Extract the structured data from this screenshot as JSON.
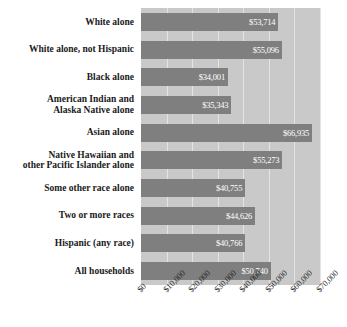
{
  "chart_data": {
    "type": "bar",
    "orientation": "horizontal",
    "title": "",
    "xlabel": "",
    "ylabel": "",
    "xlim": [
      0,
      70000
    ],
    "grid": true,
    "legend": "none",
    "bar_color": "#7f7f7f",
    "plot_background": "#c9c9c9",
    "value_label_color": "#ffffff",
    "categories": [
      "White alone",
      "White alone, not Hispanic",
      "Black alone",
      "American Indian and\nAlaska Native alone",
      "Asian alone",
      "Native Hawaiian and\nother Pacific Islander alone",
      "Some other race alone",
      "Two or more races",
      "Hispanic (any race)",
      "All households"
    ],
    "values": [
      53714,
      55096,
      34001,
      35343,
      66935,
      55273,
      40755,
      44626,
      40766,
      50740
    ],
    "value_labels": [
      "$53,714",
      "$55,096",
      "$34,001",
      "$35,343",
      "$66,935",
      "$55,273",
      "$40,755",
      "$44,626",
      "$40,766",
      "$50,740"
    ],
    "xticks": [
      0,
      10000,
      20000,
      30000,
      40000,
      50000,
      60000,
      70000
    ],
    "xtick_labels": [
      "$0",
      "$10,000",
      "$20,000",
      "$30,000",
      "$40,000",
      "$50,000",
      "$60,000",
      "$70,000"
    ]
  },
  "rows": [
    {
      "label_lines": [
        "White alone"
      ],
      "value_label": "$53,714"
    },
    {
      "label_lines": [
        "White alone, not Hispanic"
      ],
      "value_label": "$55,096"
    },
    {
      "label_lines": [
        "Black alone"
      ],
      "value_label": "$34,001"
    },
    {
      "label_lines": [
        "American Indian and",
        "Alaska Native alone"
      ],
      "value_label": "$35,343"
    },
    {
      "label_lines": [
        "Asian alone"
      ],
      "value_label": "$66,935"
    },
    {
      "label_lines": [
        "Native Hawaiian and",
        "other Pacific Islander alone"
      ],
      "value_label": "$55,273"
    },
    {
      "label_lines": [
        "Some other race alone"
      ],
      "value_label": "$40,755"
    },
    {
      "label_lines": [
        "Two or more races"
      ],
      "value_label": "$44,626"
    },
    {
      "label_lines": [
        "Hispanic (any race)"
      ],
      "value_label": "$40,766"
    },
    {
      "label_lines": [
        "All households"
      ],
      "value_label": "$50,740"
    }
  ]
}
